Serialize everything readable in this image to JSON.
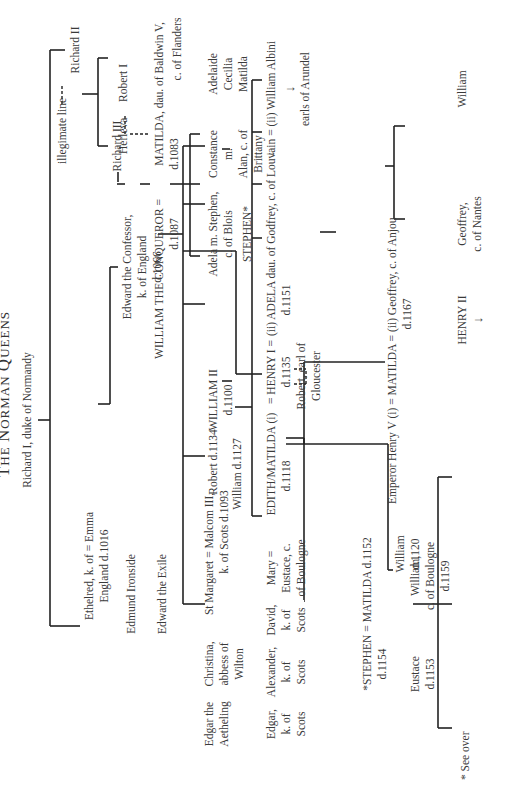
{
  "title": {
    "first": "T",
    "rest": "HE ",
    "n": "N",
    "orman": "ORMAN ",
    "q": "Q",
    "ueens": "UEENS"
  },
  "legend": {
    "line": "------",
    "label": "illegimate line"
  },
  "footnote": "* See over",
  "people": {
    "richard1": "Richard I, duke of Normandy",
    "richard2": "Richard II",
    "richard3": "Richard III",
    "robert1": "Robert I",
    "herleva": "Herleva",
    "ethelred_1": "Ethelred, k. of = Emma",
    "ethelred_2": "England d.1016",
    "edward_confessor_1": "Edward the Confessor,",
    "edward_confessor_2": "k. of England",
    "edward_confessor_3": "d.1066",
    "edmund_ironside": "Edmund Ironside",
    "edward_exile": "Edward the Exile",
    "edgar_atheling_1": "Edgar the",
    "edgar_atheling_2": "Aetheling",
    "christina_1": "Christina,",
    "christina_2": "abbess of",
    "christina_3": "Wilton",
    "margaret_malcolm_1": "St Margaret = Malcom III,",
    "margaret_malcolm_2": "k. of Scots d.1093",
    "edgar_scots_1": "Edgar,",
    "edgar_scots_2": "k. of",
    "edgar_scots_3": "Scots",
    "alexander_1": "Alexander,",
    "alexander_2": "k. of",
    "alexander_3": "Scots",
    "david_1": "David,",
    "david_2": "k. of",
    "david_3": "Scots",
    "mary_1": "Mary =",
    "mary_2": "Eustace, c.",
    "mary_3": "of Boulogne",
    "edith_1": "EDITH/MATILDA (i)",
    "edith_2": "d.1118",
    "stephen_1": "*STEPHEN  = MATILDA d.1152",
    "stephen_2": "d.1154",
    "eustace_1": "Eustace",
    "eustace_2": "d.1153",
    "william_boulogne_1": "William,",
    "william_boulogne_2": "c. of Boulogne",
    "william_boulogne_3": "d.1159",
    "conqueror_1": "WILLIAM THE CONQUEROR =",
    "conqueror_2": "d.1087",
    "matilda_flanders_1": "MATILDA, dau. of Baldwin V,",
    "matilda_flanders_2": "d.1083",
    "matilda_flanders_3": "c. of Flanders",
    "robert_curthose_1": "Robert d.1134",
    "william_clito": "William d.1127",
    "william2_1": "WILLIAM II",
    "william2_2": "d.1100",
    "adela_1": "Adela m. Stephen,",
    "adela_2": "c. of Blois",
    "stephen_star": "STEPHEN*",
    "constance_1": "Constance",
    "constance_2": "m.",
    "constance_3": "Alan, c. of",
    "constance_4": "Brittany",
    "adelaide_1": "Adelaide",
    "adelaide_2": "Cecilia",
    "adelaide_3": "Matilda",
    "henry1_1": "= HENRY I =",
    "henry1_2": "d.1135",
    "robert_gloucester_1": "Robert, earl of",
    "robert_gloucester_2": "Gloucester",
    "adela_louvain_1": "(ii) ADELA dau. of Godfrey, c. of Louvain = (ii) William Albini",
    "adela_louvain_2": "d.1151",
    "arundel": "earls of Arundel",
    "william_1120_1": "William",
    "william_1120_2": "d.1120",
    "empress_1": "Emperor Henry V (i) = MATILDA = (ii) Geoffrey, c. of Anjou",
    "empress_2": "d.1167",
    "henry2": "HENRY II",
    "geoffrey_nantes_1": "Geoffrey,",
    "geoffrey_nantes_2": "c. of Nantes",
    "william_anjou": "William"
  },
  "arrow_glyph": "↓"
}
